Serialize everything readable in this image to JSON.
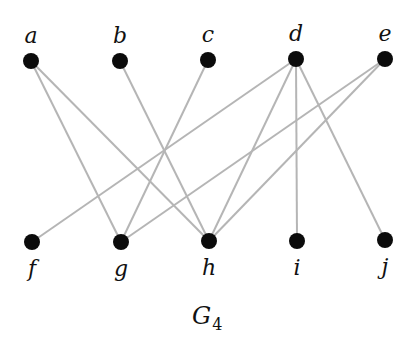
{
  "graph": {
    "caption": {
      "main": "G",
      "subscript": "4"
    },
    "nodes": [
      {
        "id": "a",
        "label": "a",
        "x": 31,
        "y": 61,
        "row": "top"
      },
      {
        "id": "b",
        "label": "b",
        "x": 120,
        "y": 61,
        "row": "top"
      },
      {
        "id": "c",
        "label": "c",
        "x": 208,
        "y": 60,
        "row": "top"
      },
      {
        "id": "d",
        "label": "d",
        "x": 296,
        "y": 59,
        "row": "top"
      },
      {
        "id": "e",
        "label": "e",
        "x": 385,
        "y": 59,
        "row": "top"
      },
      {
        "id": "f",
        "label": "f",
        "x": 32,
        "y": 242,
        "row": "bottom"
      },
      {
        "id": "g",
        "label": "g",
        "x": 121,
        "y": 242,
        "row": "bottom"
      },
      {
        "id": "h",
        "label": "h",
        "x": 209,
        "y": 241,
        "row": "bottom"
      },
      {
        "id": "i",
        "label": "i",
        "x": 297,
        "y": 241,
        "row": "bottom"
      },
      {
        "id": "j",
        "label": "j",
        "x": 385,
        "y": 240,
        "row": "bottom"
      }
    ],
    "edges": [
      [
        "a",
        "g"
      ],
      [
        "a",
        "h"
      ],
      [
        "b",
        "h"
      ],
      [
        "c",
        "g"
      ],
      [
        "d",
        "f"
      ],
      [
        "d",
        "h"
      ],
      [
        "d",
        "i"
      ],
      [
        "d",
        "j"
      ],
      [
        "e",
        "g"
      ],
      [
        "e",
        "h"
      ]
    ],
    "colors": {
      "node": "#0b0b0b",
      "edge": "#b5b5b5",
      "background": "#ffffff"
    }
  }
}
